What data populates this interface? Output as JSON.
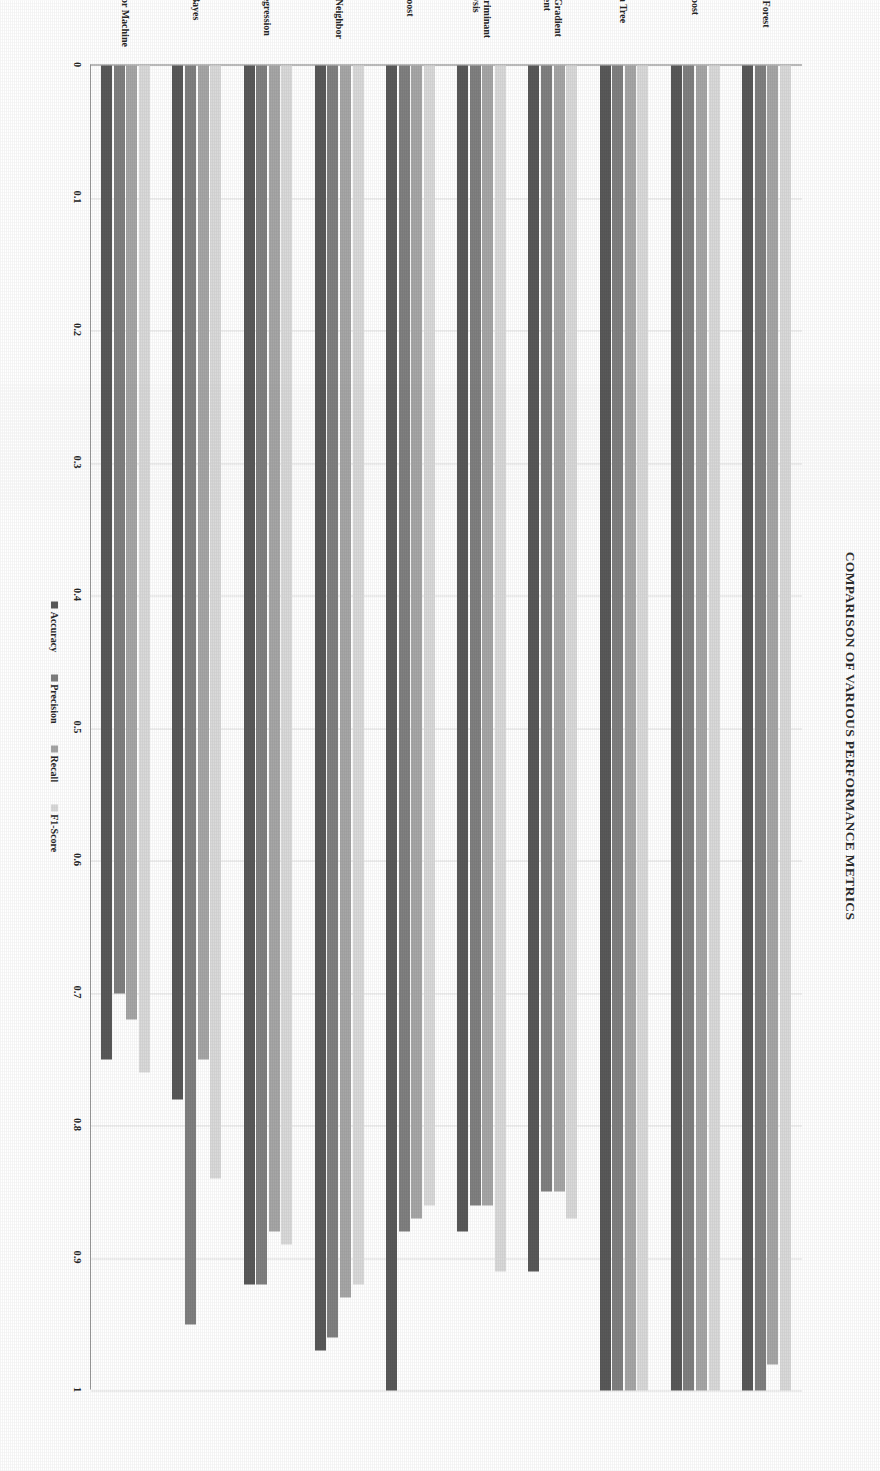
{
  "chart_data": {
    "type": "bar",
    "orientation": "horizontal",
    "title": "Comparison of Various Performance Metrics",
    "xlabel": "",
    "ylabel": "",
    "grid": true,
    "legend_position": "center",
    "value_axis": {
      "min": 0,
      "max": 1,
      "step": 0.1,
      "direction": "reversed",
      "ticks": [
        "1",
        "0.9",
        "0.8",
        "0.7",
        "0.6",
        "0.5",
        "0.4",
        "0.3",
        "0.2",
        "0.1",
        "0"
      ]
    },
    "categories": [
      "Random Forest",
      "XG Boost",
      "Decision Tree",
      "Stochastic Gradient\nDescent",
      "Linear Discriminant\nAnalysis",
      "Ada Boost",
      "K- Nearest Neighbor",
      "Logistic Regression",
      "Naive Bayes",
      "Support Vector Machine"
    ],
    "series": [
      {
        "name": "Accuracy",
        "color": "#595959",
        "values": [
          1.0,
          1.0,
          1.0,
          0.91,
          0.88,
          1.0,
          0.97,
          0.92,
          0.78,
          0.75
        ]
      },
      {
        "name": "Precision",
        "color": "#808080",
        "values": [
          1.0,
          1.0,
          1.0,
          0.85,
          0.86,
          0.88,
          0.96,
          0.92,
          0.95,
          0.7
        ]
      },
      {
        "name": "Recall",
        "color": "#a6a6a6",
        "values": [
          0.98,
          1.0,
          1.0,
          0.85,
          0.86,
          0.87,
          0.93,
          0.88,
          0.75,
          0.72
        ]
      },
      {
        "name": "F1-Score",
        "color": "#d9d9d9",
        "values": [
          1.0,
          1.0,
          1.0,
          0.87,
          0.91,
          0.86,
          0.92,
          0.89,
          0.84,
          0.76
        ]
      }
    ]
  },
  "legend": {
    "items": [
      {
        "label": "Accuracy"
      },
      {
        "label": "Precision"
      },
      {
        "label": "Recall"
      },
      {
        "label": "F1-Score"
      }
    ]
  }
}
